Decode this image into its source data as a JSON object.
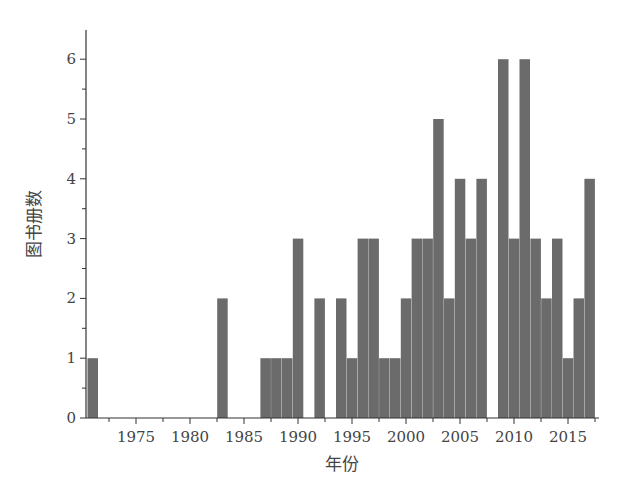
{
  "chart_data": {
    "type": "bar",
    "title": "",
    "xlabel": "年份",
    "ylabel": "图书册数",
    "x": [
      1971,
      1972,
      1973,
      1974,
      1975,
      1976,
      1977,
      1978,
      1979,
      1980,
      1981,
      1982,
      1983,
      1984,
      1985,
      1986,
      1987,
      1988,
      1989,
      1990,
      1991,
      1992,
      1993,
      1994,
      1995,
      1996,
      1997,
      1998,
      1999,
      2000,
      2001,
      2002,
      2003,
      2004,
      2005,
      2006,
      2007,
      2008,
      2009,
      2010,
      2011,
      2012,
      2013,
      2014,
      2015,
      2016,
      2017
    ],
    "values": [
      1,
      0,
      0,
      0,
      0,
      0,
      0,
      0,
      0,
      0,
      0,
      0,
      2,
      0,
      0,
      0,
      1,
      1,
      1,
      3,
      0,
      2,
      0,
      2,
      1,
      3,
      3,
      1,
      1,
      2,
      3,
      3,
      5,
      2,
      4,
      3,
      4,
      0,
      6,
      3,
      6,
      3,
      2,
      3,
      1,
      2,
      4
    ],
    "xticks": [
      1975,
      1980,
      1985,
      1990,
      1995,
      2000,
      2005,
      2010,
      2015
    ],
    "yticks": [
      0,
      1,
      2,
      3,
      4,
      5,
      6
    ],
    "ylim": [
      0,
      6.5
    ],
    "xlim": [
      1969.6,
      2017.8
    ],
    "grid": false,
    "bar_color": "#6b6b6b"
  }
}
